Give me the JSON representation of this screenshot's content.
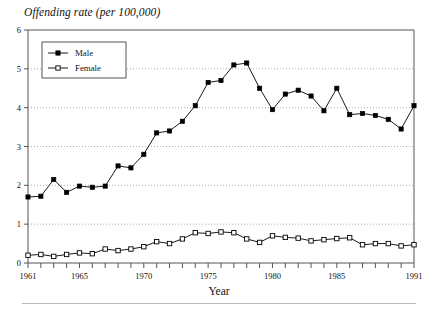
{
  "chart_data": {
    "type": "line",
    "title": "Offending rate (per 100,000)",
    "xlabel": "Year",
    "ylabel": "",
    "xlim": [
      1961,
      1991
    ],
    "ylim": [
      0,
      6
    ],
    "grid": true,
    "legend_position": "top-left",
    "x": [
      1961,
      1962,
      1963,
      1964,
      1965,
      1966,
      1967,
      1968,
      1969,
      1970,
      1971,
      1972,
      1973,
      1974,
      1975,
      1976,
      1977,
      1978,
      1979,
      1980,
      1981,
      1982,
      1983,
      1984,
      1985,
      1986,
      1987,
      1988,
      1989,
      1990,
      1991
    ],
    "xticks": [
      1961,
      1962,
      1963,
      1964,
      1965,
      1966,
      1967,
      1968,
      1969,
      1970,
      1971,
      1972,
      1973,
      1974,
      1975,
      1976,
      1977,
      1978,
      1979,
      1980,
      1981,
      1982,
      1983,
      1984,
      1985,
      1986,
      1987,
      1988,
      1989,
      1990,
      1991
    ],
    "xtick_labels": [
      "1961",
      "1965",
      "1970",
      "1975",
      "1980",
      "1985",
      "1991"
    ],
    "xtick_label_values": [
      1961,
      1965,
      1970,
      1975,
      1980,
      1985,
      1991
    ],
    "yticks": [
      0,
      1,
      2,
      3,
      4,
      5,
      6
    ],
    "ytick_labels": [
      "0",
      "1",
      "2",
      "3",
      "4",
      "5",
      "6"
    ],
    "series": [
      {
        "name": "Male",
        "marker": "filled-square",
        "color": "#000000",
        "values": [
          1.7,
          1.72,
          2.15,
          1.82,
          1.98,
          1.95,
          1.98,
          2.5,
          2.45,
          2.8,
          3.35,
          3.4,
          3.65,
          4.05,
          4.65,
          4.7,
          5.1,
          5.15,
          4.5,
          3.95,
          4.35,
          4.45,
          4.3,
          3.92,
          4.5,
          3.82,
          3.85,
          3.8,
          3.7,
          3.45,
          4.05
        ]
      },
      {
        "name": "Female",
        "marker": "open-square",
        "color": "#000000",
        "values": [
          0.2,
          0.22,
          0.17,
          0.22,
          0.26,
          0.24,
          0.36,
          0.32,
          0.36,
          0.42,
          0.55,
          0.5,
          0.62,
          0.78,
          0.76,
          0.8,
          0.78,
          0.62,
          0.53,
          0.7,
          0.66,
          0.64,
          0.57,
          0.6,
          0.63,
          0.65,
          0.47,
          0.5,
          0.5,
          0.44,
          0.47
        ]
      }
    ]
  },
  "legend": {
    "items": [
      {
        "label": "Male"
      },
      {
        "label": "Female"
      }
    ]
  },
  "axis": {
    "x_title": "Year"
  }
}
